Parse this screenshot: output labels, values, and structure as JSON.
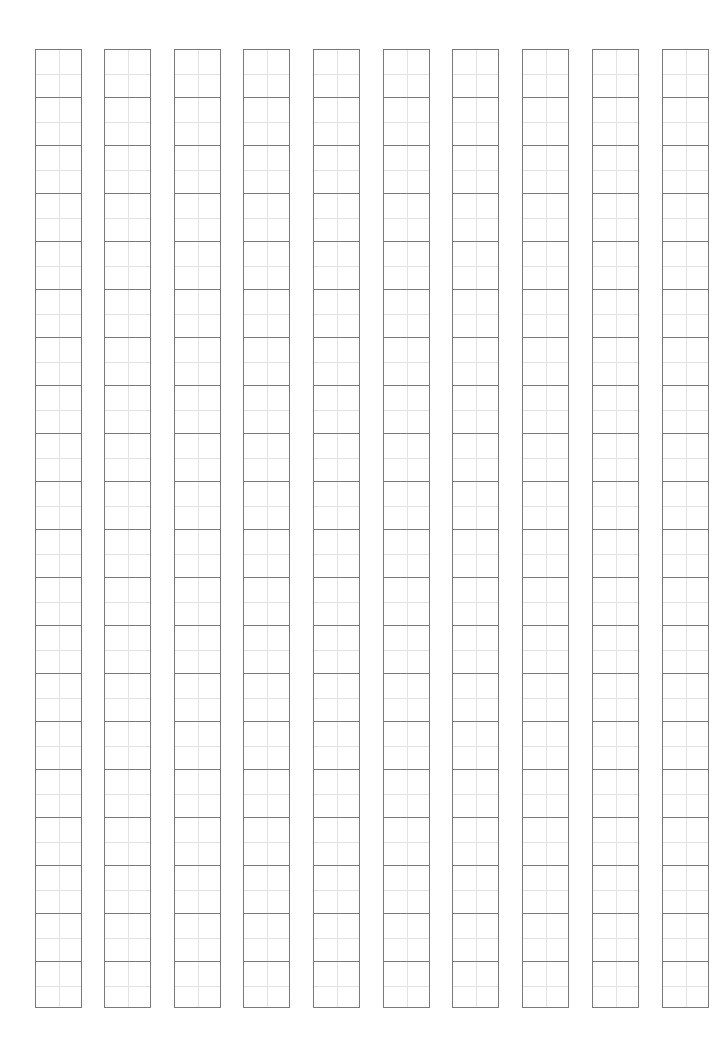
{
  "sheet": {
    "type": "writing-practice-grid",
    "columns": 10,
    "rows_per_column": 20,
    "column_left_positions": [
      35,
      104,
      174,
      243,
      313,
      383,
      452,
      522,
      592,
      662
    ],
    "column_top": 49,
    "cell_width": 47,
    "cell_height": 48,
    "colors": {
      "border": "#7a7a7a",
      "guide": "#e2e2e2",
      "background": "#ffffff"
    }
  }
}
